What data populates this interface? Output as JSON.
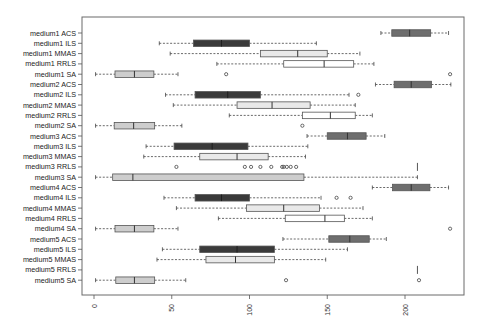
{
  "chart_data": {
    "type": "boxplot",
    "orientation": "horizontal",
    "title": "",
    "xlabel": "",
    "ylabel": "",
    "xlim": [
      -6,
      239
    ],
    "x_ticks": [
      0,
      50,
      100,
      150,
      200
    ],
    "x_tick_labels": [
      "0",
      "50",
      "100",
      "150",
      "200"
    ],
    "x_tick_label_rotation": 90,
    "grid": false,
    "legend": null,
    "colors": {
      "ACS": "#6e6e6e",
      "ILS": "#3a3a3a",
      "MMAS": "#e9e9e9",
      "RRLS": "#ffffff",
      "SA": "#cdcdcd",
      "border": "#555555",
      "frame": "#6a6a6a"
    },
    "series": [
      {
        "name": "medium1 ACS",
        "algo": "ACS",
        "whisker_low": 184.5,
        "q1": 191.5,
        "median": 203,
        "q3": 216.5,
        "whisker_high": 228,
        "outliers": []
      },
      {
        "name": "medium1 ILS",
        "algo": "ILS",
        "whisker_low": 42,
        "q1": 64,
        "median": 82,
        "q3": 100,
        "whisker_high": 143,
        "outliers": []
      },
      {
        "name": "medium1 MMAS",
        "algo": "MMAS",
        "whisker_low": 49,
        "q1": 107,
        "median": 131,
        "q3": 150,
        "whisker_high": 171,
        "outliers": []
      },
      {
        "name": "medium1 RRLS",
        "algo": "RRLS",
        "whisker_low": 79,
        "q1": 122,
        "median": 148,
        "q3": 167,
        "whisker_high": 180,
        "outliers": []
      },
      {
        "name": "medium1 SA",
        "algo": "SA",
        "whisker_low": 1,
        "q1": 13.5,
        "median": 26,
        "q3": 38.5,
        "whisker_high": 54,
        "outliers": [
          85,
          229
        ]
      },
      {
        "name": "medium2 ACS",
        "algo": "ACS",
        "whisker_low": 181,
        "q1": 193,
        "median": 204,
        "q3": 217,
        "whisker_high": 229.5,
        "outliers": []
      },
      {
        "name": "medium2 ILS",
        "algo": "ILS",
        "whisker_low": 46,
        "q1": 65,
        "median": 86,
        "q3": 107,
        "whisker_high": 164,
        "outliers": [
          170
        ]
      },
      {
        "name": "medium2 MMAS",
        "algo": "MMAS",
        "whisker_low": 51,
        "q1": 92,
        "median": 114.5,
        "q3": 139,
        "whisker_high": 168,
        "outliers": []
      },
      {
        "name": "medium2 RRLS",
        "algo": "RRLS",
        "whisker_low": 87,
        "q1": 134,
        "median": 152,
        "q3": 168,
        "whisker_high": 179,
        "outliers": []
      },
      {
        "name": "medium2 SA",
        "algo": "SA",
        "whisker_low": 1,
        "q1": 13,
        "median": 25.5,
        "q3": 39,
        "whisker_high": 56.5,
        "outliers": [
          134
        ]
      },
      {
        "name": "medium3 ACS",
        "algo": "ACS",
        "whisker_low": 137,
        "q1": 150,
        "median": 163,
        "q3": 175,
        "whisker_high": 187,
        "outliers": []
      },
      {
        "name": "medium3 ILS",
        "algo": "ILS",
        "whisker_low": 33.5,
        "q1": 51.5,
        "median": 76,
        "q3": 99,
        "whisker_high": 137.5,
        "outliers": []
      },
      {
        "name": "medium3 MMAS",
        "algo": "MMAS",
        "whisker_low": 32,
        "q1": 68,
        "median": 92,
        "q3": 112,
        "whisker_high": 136,
        "outliers": []
      },
      {
        "name": "medium3 RRLS",
        "algo": "RRLS",
        "whisker_low": 208,
        "q1": 208,
        "median": 208,
        "q3": 208,
        "whisker_high": 208,
        "outliers": [
          53,
          97,
          101,
          107,
          114,
          121,
          122,
          124,
          126.5,
          130
        ]
      },
      {
        "name": "medium3 SA",
        "algo": "SA",
        "whisker_low": 1,
        "q1": 12,
        "median": 25,
        "q3": 135,
        "whisker_high": 208,
        "outliers": []
      },
      {
        "name": "medium4 ACS",
        "algo": "ACS",
        "whisker_low": 179,
        "q1": 192,
        "median": 204,
        "q3": 216,
        "whisker_high": 228,
        "outliers": []
      },
      {
        "name": "medium4 ILS",
        "algo": "ILS",
        "whisker_low": 45,
        "q1": 65,
        "median": 82,
        "q3": 100,
        "whisker_high": 146,
        "outliers": [
          156,
          165
        ]
      },
      {
        "name": "medium4 MMAS",
        "algo": "MMAS",
        "whisker_low": 53,
        "q1": 98,
        "median": 122,
        "q3": 145,
        "whisker_high": 173,
        "outliers": []
      },
      {
        "name": "medium4 RRLS",
        "algo": "RRLS",
        "whisker_low": 80,
        "q1": 123,
        "median": 148.5,
        "q3": 161,
        "whisker_high": 179,
        "outliers": []
      },
      {
        "name": "medium4 SA",
        "algo": "SA",
        "whisker_low": 1,
        "q1": 13.5,
        "median": 26,
        "q3": 38.5,
        "whisker_high": 54,
        "outliers": [
          229
        ]
      },
      {
        "name": "medium5 ACS",
        "algo": "ACS",
        "whisker_low": 121.5,
        "q1": 151,
        "median": 164.5,
        "q3": 177,
        "whisker_high": 188,
        "outliers": []
      },
      {
        "name": "medium5 ILS",
        "algo": "ILS",
        "whisker_low": 44,
        "q1": 68,
        "median": 92,
        "q3": 116,
        "whisker_high": 163,
        "outliers": []
      },
      {
        "name": "medium5 MMAS",
        "algo": "MMAS",
        "whisker_low": 40.5,
        "q1": 72,
        "median": 91,
        "q3": 116,
        "whisker_high": 149,
        "outliers": []
      },
      {
        "name": "medium5 RRLS",
        "algo": "RRLS",
        "whisker_low": 208,
        "q1": 208,
        "median": 208,
        "q3": 208,
        "whisker_high": 208,
        "outliers": []
      },
      {
        "name": "medium5 SA",
        "algo": "SA",
        "whisker_low": 1,
        "q1": 14,
        "median": 26,
        "q3": 39,
        "whisker_high": 59,
        "outliers": [
          123.5,
          209
        ]
      }
    ]
  }
}
